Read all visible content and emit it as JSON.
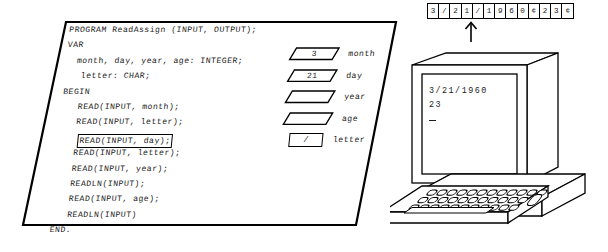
{
  "code_panel": {
    "lines": [
      "PROGRAM ReadAssign (INPUT, OUTPUT);",
      "VAR",
      "  month, day, year, age: INTEGER;",
      "   letter: CHAR;",
      "BEGIN",
      "   READ(INPUT, month);",
      "   READ(INPUT, letter);",
      "   READ(INPUT, day);",
      "   READ(INPUT, letter);",
      "   READ(INPUT, year);",
      "   READLN(INPUT);",
      "   READ(INPUT, age);",
      "   READLN(INPUT)",
      "END."
    ],
    "highlighted_line_index": 7,
    "highlighted_line_text": "READ(INPUT, day);"
  },
  "variables": [
    {
      "name": "month",
      "value": "3",
      "shape": "parallelogram"
    },
    {
      "name": "day",
      "value": "21",
      "shape": "parallelogram"
    },
    {
      "name": "year",
      "value": "",
      "shape": "parallelogram"
    },
    {
      "name": "age",
      "value": "",
      "shape": "parallelogram"
    },
    {
      "name": "letter",
      "value": "/",
      "shape": "rectangle"
    }
  ],
  "input_stream": {
    "cells": [
      "3",
      "/",
      "2",
      "1",
      "/",
      "1",
      "9",
      "6",
      "0",
      "¢",
      "2",
      "3",
      "¢"
    ],
    "pointer_cell_index": 4,
    "pointer_icon": "up-arrow-icon"
  },
  "terminal": {
    "screen_lines": [
      "3/21/1960",
      "23"
    ],
    "cursor": "_"
  },
  "colors": {
    "ink": "#000000",
    "paper": "#ffffff",
    "text": "#1c1c1c"
  }
}
